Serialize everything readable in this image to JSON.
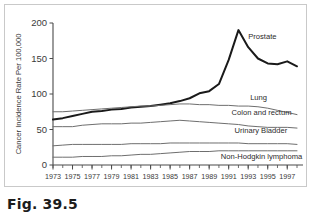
{
  "caption": "Fig. 39.5",
  "chart_data": {
    "type": "line",
    "title": "",
    "xlabel": "Year",
    "ylabel": "Cancer Incidence Rate Per 100,000",
    "xlim": [
      1973,
      1998
    ],
    "ylim": [
      0,
      200
    ],
    "yticks": [
      0,
      50,
      100,
      150,
      200
    ],
    "ytick_labels": [
      "0",
      "50",
      "100",
      "150",
      "200"
    ],
    "xticks": [
      1973,
      1975,
      1977,
      1979,
      1981,
      1983,
      1985,
      1987,
      1989,
      1991,
      1993,
      1995,
      1997
    ],
    "xtick_labels": [
      "1973",
      "1975",
      "1977",
      "1979",
      "1981",
      "1983",
      "1985",
      "1987",
      "1989",
      "1991",
      "1993",
      "1995",
      "1997"
    ],
    "minor_xticks_every": 1,
    "grid": false,
    "legend_position": "inline-right",
    "x": [
      1973,
      1974,
      1975,
      1976,
      1977,
      1978,
      1979,
      1980,
      1981,
      1982,
      1983,
      1984,
      1985,
      1986,
      1987,
      1988,
      1989,
      1990,
      1991,
      1992,
      1993,
      1994,
      1995,
      1996,
      1997,
      1998
    ],
    "series": [
      {
        "name": "Prostate",
        "label": "Prostate",
        "emphasis": true,
        "color": "#1a1a1a",
        "values": [
          64,
          66,
          69,
          72,
          75,
          76,
          78,
          79,
          81,
          82,
          83,
          85,
          87,
          90,
          94,
          101,
          104,
          114,
          148,
          190,
          166,
          150,
          143,
          142,
          146,
          139
        ]
      },
      {
        "name": "Lung",
        "label": "Lung",
        "emphasis": false,
        "color": "#6e6e6e",
        "values": [
          75,
          75,
          76,
          77,
          78,
          79,
          80,
          81,
          82,
          83,
          83,
          84,
          85,
          86,
          86,
          85,
          85,
          84,
          84,
          83,
          83,
          82,
          80,
          77,
          74,
          71
        ]
      },
      {
        "name": "Colon and rectum",
        "label": "Colon and rectum",
        "emphasis": false,
        "color": "#6e6e6e",
        "values": [
          54,
          54,
          54,
          56,
          57,
          58,
          58,
          58,
          59,
          59,
          60,
          61,
          62,
          63,
          62,
          61,
          60,
          59,
          58,
          57,
          55,
          54,
          53,
          53,
          53,
          52
        ]
      },
      {
        "name": "Urinary Bladder",
        "label": "Urinary Bladder",
        "emphasis": false,
        "color": "#6e6e6e",
        "values": [
          27,
          28,
          29,
          29,
          29,
          29,
          29,
          29,
          30,
          30,
          30,
          30,
          31,
          31,
          31,
          31,
          31,
          31,
          31,
          31,
          30,
          30,
          30,
          30,
          30,
          29
        ]
      },
      {
        "name": "Non-Hodgkin lymphoma",
        "label": "Non-Hodgkin lymphoma",
        "emphasis": false,
        "color": "#6e6e6e",
        "values": [
          11,
          11,
          11,
          12,
          12,
          12,
          13,
          13,
          14,
          15,
          15,
          16,
          17,
          18,
          19,
          19,
          19,
          20,
          20,
          20,
          20,
          20,
          20,
          20,
          20,
          20
        ]
      }
    ],
    "series_label_positions": [
      {
        "name": "Prostate",
        "x": 1993.0,
        "y": 178
      },
      {
        "name": "Lung",
        "x": 1993.2,
        "y": 92
      },
      {
        "name": "Colon and rectum",
        "x": 1991.3,
        "y": 70
      },
      {
        "name": "Urinary Bladder",
        "x": 1991.6,
        "y": 45
      },
      {
        "name": "Non-Hodgkin lymphoma",
        "x": 1990.2,
        "y": 8
      }
    ]
  }
}
